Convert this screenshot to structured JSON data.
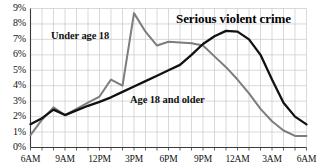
{
  "chart_data": {
    "type": "line",
    "title": "Serious violent crime",
    "xlabel": "",
    "ylabel": "",
    "grid": true,
    "legend_position": "inline-annotations",
    "ylim": [
      0,
      9
    ],
    "yticks": [
      "0%",
      "1%",
      "2%",
      "3%",
      "4%",
      "5%",
      "6%",
      "7%",
      "8%",
      "9%"
    ],
    "ytick_values": [
      0,
      1,
      2,
      3,
      4,
      5,
      6,
      7,
      8,
      9
    ],
    "xticks": [
      "6AM",
      "9AM",
      "12PM",
      "3PM",
      "6PM",
      "9PM",
      "12AM",
      "3AM",
      "6AM"
    ],
    "x": [
      "6AM",
      "7AM",
      "8AM",
      "9AM",
      "10AM",
      "11AM",
      "12PM",
      "1PM",
      "2PM",
      "3PM",
      "4PM",
      "5PM",
      "6PM",
      "7PM",
      "8PM",
      "9PM",
      "10PM",
      "11PM",
      "12AM",
      "1AM",
      "2AM",
      "3AM",
      "4AM",
      "5AM",
      "6AM"
    ],
    "series": [
      {
        "name": "Under age 18",
        "color": "#7d7d7d",
        "values": [
          0.8,
          1.8,
          2.6,
          2.1,
          2.5,
          2.9,
          3.3,
          4.4,
          4.0,
          8.7,
          7.5,
          6.6,
          6.85,
          6.8,
          6.75,
          6.6,
          5.9,
          5.2,
          4.4,
          3.5,
          2.5,
          1.7,
          1.1,
          0.75,
          0.75
        ]
      },
      {
        "name": "Age 18 and older",
        "color": "#111111",
        "values": [
          1.5,
          1.9,
          2.45,
          2.1,
          2.4,
          2.7,
          2.95,
          3.25,
          3.6,
          3.95,
          4.3,
          4.65,
          5.0,
          5.35,
          6.0,
          6.7,
          7.2,
          7.55,
          7.5,
          7.0,
          6.0,
          4.4,
          2.9,
          2.0,
          1.5
        ]
      }
    ],
    "annotations": [
      {
        "text": "Under age 18",
        "series": "Under age 18"
      },
      {
        "text": "Age 18 and older",
        "series": "Age 18 and older"
      }
    ]
  }
}
